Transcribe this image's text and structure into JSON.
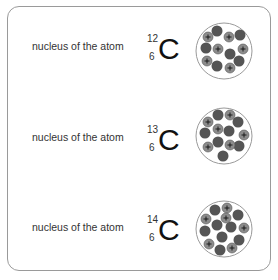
{
  "isotopes": [
    {
      "label": "nucleus of the atom",
      "mass_number": "12",
      "atomic_number": "6",
      "symbol": "C",
      "protons": 6,
      "neutrons": 6
    },
    {
      "label": "nucleus of the atom",
      "mass_number": "13",
      "atomic_number": "6",
      "symbol": "C",
      "protons": 6,
      "neutrons": 7
    },
    {
      "label": "nucleus of the atom",
      "mass_number": "14",
      "atomic_number": "6",
      "symbol": "C",
      "protons": 6,
      "neutrons": 8
    }
  ],
  "colors": {
    "neutron": "#555555",
    "proton": "#8c8c8c",
    "nucleus_outline": "#9a9a9a",
    "card_border": "#9a9a9a"
  }
}
